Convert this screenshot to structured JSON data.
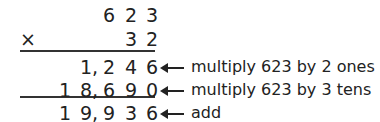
{
  "problem": {
    "rows": [
      {
        "id": "multiplicand",
        "digits": [
          "",
          "",
          "6",
          "2",
          "3"
        ]
      },
      {
        "id": "multiplier",
        "digits": [
          "",
          "",
          "",
          "3",
          "2"
        ],
        "operator": "×"
      },
      {
        "id": "partial-ones",
        "digits": [
          "",
          "1,",
          "2",
          "4",
          "6"
        ],
        "note": "multiply 623 by 2 ones"
      },
      {
        "id": "partial-tens",
        "digits": [
          "1",
          "8,",
          "6",
          "9",
          "0"
        ],
        "note": "multiply 623 by 3 tens"
      },
      {
        "id": "sum",
        "digits": [
          "1",
          "9,",
          "9",
          "3",
          "6"
        ],
        "note": "add"
      }
    ]
  }
}
